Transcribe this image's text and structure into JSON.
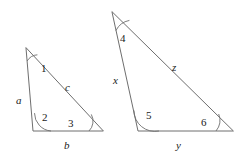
{
  "figure": {
    "stroke_color": "#6e6e6e",
    "label_color": "#1a1a1a",
    "background": "#ffffff",
    "triangles": [
      {
        "name": "small-triangle",
        "sides": [
          {
            "id": "a",
            "label": "a",
            "position": "left"
          },
          {
            "id": "b",
            "label": "b",
            "position": "bottom"
          },
          {
            "id": "c",
            "label": "c",
            "position": "hypotenuse"
          }
        ],
        "angles": [
          {
            "id": "1",
            "label": "1",
            "vertex": "apex"
          },
          {
            "id": "2",
            "label": "2",
            "vertex": "bottom-left"
          },
          {
            "id": "3",
            "label": "3",
            "vertex": "bottom-right"
          }
        ]
      },
      {
        "name": "large-triangle",
        "sides": [
          {
            "id": "x",
            "label": "x",
            "position": "left"
          },
          {
            "id": "y",
            "label": "y",
            "position": "bottom"
          },
          {
            "id": "z",
            "label": "z",
            "position": "hypotenuse"
          }
        ],
        "angles": [
          {
            "id": "4",
            "label": "4",
            "vertex": "apex"
          },
          {
            "id": "5",
            "label": "5",
            "vertex": "bottom-left"
          },
          {
            "id": "6",
            "label": "6",
            "vertex": "bottom-right"
          }
        ]
      }
    ]
  }
}
